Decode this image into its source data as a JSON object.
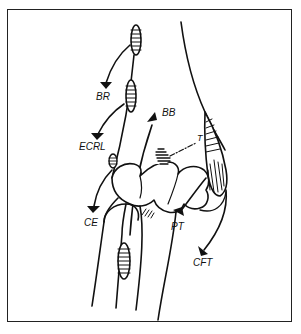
{
  "figure": {
    "type": "anatomical line drawing",
    "colors": {
      "ink": "#111111",
      "background": "#ffffff",
      "frame": "#222222"
    }
  },
  "labels": {
    "br": "BR",
    "ecrl": "ECRL",
    "bb": "BB",
    "t": "T",
    "ce": "CE",
    "pt": "PT",
    "cft": "CFT"
  }
}
